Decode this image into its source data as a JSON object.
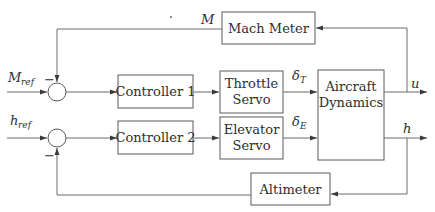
{
  "diagram": {
    "type": "block-diagram",
    "title_fragment": "",
    "blocks": {
      "mach_meter": "Mach Meter",
      "controller_1": "Controller 1",
      "controller_2": "Controller 2",
      "throttle_servo": [
        "Throttle",
        "Servo"
      ],
      "elevator_servo": [
        "Elevator",
        "Servo"
      ],
      "aircraft_dynamics": [
        "Aircraft",
        "Dynamics"
      ],
      "altimeter": "Altimeter"
    },
    "signals": {
      "mach_ref": {
        "main": "M",
        "sub": "ref"
      },
      "h_ref": {
        "main": "h",
        "sub": "ref"
      },
      "mach_feedback": "M",
      "delta_t": {
        "main": "δ",
        "sub": "T"
      },
      "delta_e": {
        "main": "δ",
        "sub": "E"
      },
      "u_out": "u",
      "h_out": "h"
    },
    "sum_signs": {
      "junction_1_feedback": "−",
      "junction_2_feedback": "−"
    },
    "colors": {
      "stroke": "#5a5a5a",
      "text": "#2e2e2e",
      "background": "#ffffff"
    }
  }
}
